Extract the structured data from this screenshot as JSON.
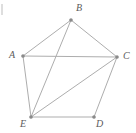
{
  "figure": {
    "width": 136,
    "height": 133,
    "background_color": "#ffffff",
    "edge_color": "#adadad",
    "vertex_color": "#8a8a8a",
    "label_color": "#5b5b5b"
  },
  "chart_data": {
    "type": "diagram",
    "title": "",
    "graph_kind": "undirected-graph",
    "vertex_count": 5,
    "edge_count": 8,
    "vertices": [
      {
        "id": "A",
        "label": "A",
        "x": 23,
        "y": 56,
        "label_x": 9,
        "label_y": 50
      },
      {
        "id": "B",
        "label": "B",
        "x": 71,
        "y": 20,
        "label_x": 76,
        "label_y": 3
      },
      {
        "id": "C",
        "label": "C",
        "x": 117,
        "y": 57,
        "label_x": 123,
        "label_y": 51
      },
      {
        "id": "D",
        "label": "D",
        "x": 94,
        "y": 117,
        "label_x": 96,
        "label_y": 119
      },
      {
        "id": "E",
        "label": "E",
        "x": 31,
        "y": 117,
        "label_x": 20,
        "label_y": 119
      }
    ],
    "edges": [
      {
        "from": "A",
        "to": "B",
        "kind": "outline"
      },
      {
        "from": "B",
        "to": "C",
        "kind": "outline"
      },
      {
        "from": "C",
        "to": "D",
        "kind": "outline"
      },
      {
        "from": "D",
        "to": "E",
        "kind": "outline"
      },
      {
        "from": "E",
        "to": "A",
        "kind": "outline"
      },
      {
        "from": "A",
        "to": "C",
        "kind": "diagonal"
      },
      {
        "from": "B",
        "to": "E",
        "kind": "diagonal"
      },
      {
        "from": "C",
        "to": "E",
        "kind": "diagonal"
      }
    ]
  }
}
